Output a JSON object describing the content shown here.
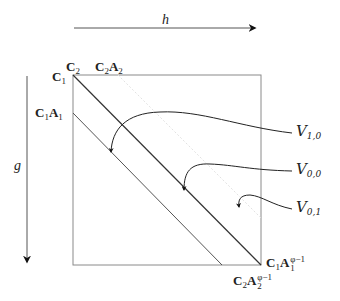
{
  "diagram": {
    "axes": {
      "horizontal": {
        "label": "h",
        "direction": "right"
      },
      "vertical": {
        "label": "g",
        "direction": "down"
      }
    },
    "corner_labels": {
      "top_left_c1": {
        "base": "C",
        "sub": "1"
      },
      "top_left_c2": {
        "base": "C",
        "sub": "2"
      },
      "top_c2a2": {
        "text": "C",
        "sub1": "2",
        "text2": "A",
        "sub2": "2"
      },
      "left_c1a1": {
        "text": "C",
        "sub1": "1",
        "text2": "A",
        "sub2": "1"
      },
      "bottom_right_c1a1": {
        "text": "C",
        "sub1": "1",
        "text2": "A",
        "sub2": "1",
        "sup": "φ−1"
      },
      "bottom_right_c2a2": {
        "text": "C",
        "sub1": "2",
        "text2": "A",
        "sub2": "2",
        "sup": "φ−1"
      }
    },
    "regions": [
      {
        "name": "V",
        "sub": "1,0"
      },
      {
        "name": "V",
        "sub": "0,0"
      },
      {
        "name": "V",
        "sub": "0,1"
      }
    ],
    "colors": {
      "line": "#333333",
      "frame": "#888888",
      "dotted": "#dddddd"
    }
  }
}
